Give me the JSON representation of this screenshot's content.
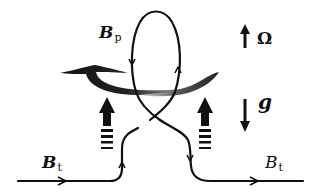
{
  "figure": {
    "labels": {
      "bp": {
        "main": "B",
        "sub": "p"
      },
      "bt_left": {
        "main": "B",
        "sub": "t"
      },
      "bt_right": {
        "main": "B",
        "sub": "t"
      },
      "omega": "Ω",
      "gravity": "g"
    },
    "icons": {
      "rotation_arrow": "arrow-up-icon",
      "gravity_arrow": "arrow-down-icon",
      "buoyancy_left": "dashed-up-arrow-icon",
      "buoyancy_right": "dashed-up-arrow-icon",
      "swirl": "rotation-swirl-icon"
    },
    "colors": {
      "line": "#111111",
      "background": "#ffffff",
      "swirl_dark": "#1a1a1a",
      "swirl_light": "#cfcfcf"
    }
  }
}
